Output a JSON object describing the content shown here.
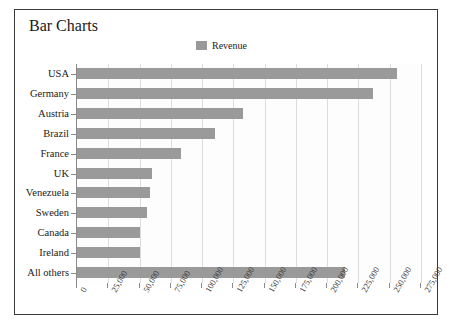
{
  "chart_data": {
    "type": "bar",
    "orientation": "horizontal",
    "title": "Bar Charts",
    "xlabel": "",
    "ylabel": "",
    "xlim": [
      0,
      275000
    ],
    "xticks": [
      "0",
      "25,000",
      "50,000",
      "75,000",
      "100,000",
      "125,000",
      "150,000",
      "175,000",
      "200,000",
      "225,000",
      "250,000",
      "275,000"
    ],
    "grid": true,
    "legend": {
      "position": "top-center",
      "entries": [
        {
          "label": "Revenue",
          "color": "#9a9a9a"
        }
      ]
    },
    "categories": [
      "USA",
      "Germany",
      "Austria",
      "Brazil",
      "France",
      "UK",
      "Venezuela",
      "Sweden",
      "Canada",
      "Ireland",
      "All others"
    ],
    "series": [
      {
        "name": "Revenue",
        "color": "#9a9a9a",
        "values": [
          256000,
          237000,
          133000,
          110000,
          83000,
          60000,
          58000,
          56000,
          50000,
          50000,
          214000
        ]
      }
    ]
  },
  "colors": {
    "bar": "#9a9a9a",
    "frame_border": "#3a3a3a",
    "gridline": "#dcdcdc",
    "axis": "#8a8a8a",
    "text": "#1a1a1a",
    "plot_background": "#fdfdfd"
  }
}
